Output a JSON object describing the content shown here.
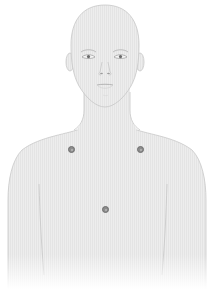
{
  "figure": {
    "skin_color": "#ececec",
    "outline_color": "#c4c4c4",
    "feature_color": "#8a8a8a",
    "background": "#ffffff"
  },
  "electrodes": [
    {
      "id": "left-shoulder",
      "x": 71,
      "y": 149
    },
    {
      "id": "right-shoulder",
      "x": 140,
      "y": 149
    },
    {
      "id": "center-chest",
      "x": 105,
      "y": 209
    }
  ],
  "electrode_color": "#8c8c8c"
}
